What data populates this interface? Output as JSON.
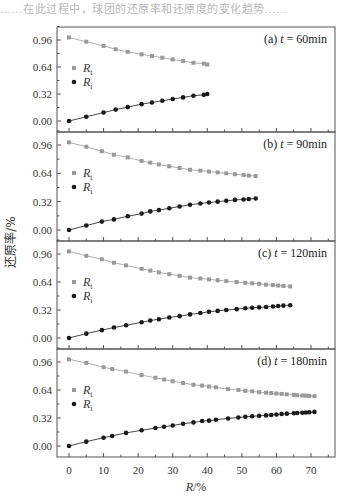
{
  "header": {
    "text": "……在此过程中，球团的还原率和还原度的变化趋势……"
  },
  "figure": {
    "ylabel": "还原率/%",
    "xlabel": "R/%",
    "xlabel_italic_part": "R",
    "xlabel_rest": "/%",
    "x_ticks": [
      0,
      10,
      20,
      30,
      40,
      50,
      60,
      70
    ],
    "y_ticks": [
      "0.00",
      "0.32",
      "0.64",
      "0.96"
    ],
    "legend": [
      {
        "label": "R",
        "sub": "t",
        "marker": "square",
        "color": "#9a9a9a"
      },
      {
        "label": "R",
        "sub": "i",
        "marker": "circle",
        "color": "#1a1a1a"
      }
    ]
  },
  "chart_data": [
    {
      "type": "scatter",
      "title": "(a) t = 60min",
      "panel_label": "(a) ",
      "t_label": "t",
      "t_value": " = 60min",
      "xlabel": "R/%",
      "ylabel": "还原率/%",
      "xlim": [
        -3,
        76
      ],
      "ylim": [
        -0.05,
        1.05
      ],
      "x_ticks": [
        0,
        10,
        20,
        30,
        40,
        50,
        60,
        70
      ],
      "y_ticks": [
        0.0,
        0.32,
        0.64,
        0.96
      ],
      "series": [
        {
          "name": "R_t",
          "marker": "square",
          "color": "#9a9a9a",
          "x": [
            0,
            5,
            10,
            13.5,
            17,
            21,
            24,
            27,
            30,
            33,
            36,
            39,
            40
          ],
          "y": [
            0.99,
            0.94,
            0.89,
            0.85,
            0.82,
            0.79,
            0.77,
            0.75,
            0.73,
            0.71,
            0.69,
            0.68,
            0.67
          ]
        },
        {
          "name": "R_i",
          "marker": "circle",
          "color": "#1a1a1a",
          "x": [
            0,
            5,
            10,
            13.5,
            17,
            21,
            24,
            27,
            30,
            33,
            36,
            39,
            40
          ],
          "y": [
            0.0,
            0.05,
            0.1,
            0.135,
            0.165,
            0.2,
            0.22,
            0.24,
            0.26,
            0.28,
            0.3,
            0.31,
            0.32
          ]
        }
      ]
    },
    {
      "type": "scatter",
      "title": "(b) t = 90min",
      "panel_label": "(b) ",
      "t_label": "t",
      "t_value": " = 90min",
      "xlabel": "R/%",
      "ylabel": "还原率/%",
      "xlim": [
        -3,
        76
      ],
      "ylim": [
        -0.05,
        1.05
      ],
      "x_ticks": [
        0,
        10,
        20,
        30,
        40,
        50,
        60,
        70
      ],
      "y_ticks": [
        0.0,
        0.32,
        0.64,
        0.96
      ],
      "series": [
        {
          "name": "R_t",
          "marker": "square",
          "color": "#9a9a9a",
          "x": [
            0,
            5,
            9.5,
            13,
            17,
            21,
            23.5,
            26,
            29,
            32,
            35,
            38,
            40.5,
            43,
            45.5,
            48,
            50.5,
            52,
            54
          ],
          "y": [
            0.99,
            0.94,
            0.89,
            0.85,
            0.82,
            0.78,
            0.76,
            0.74,
            0.72,
            0.7,
            0.68,
            0.67,
            0.66,
            0.65,
            0.64,
            0.63,
            0.62,
            0.615,
            0.61
          ]
        },
        {
          "name": "R_i",
          "marker": "circle",
          "color": "#1a1a1a",
          "x": [
            0,
            5,
            9.5,
            13,
            17,
            21,
            23.5,
            26,
            29,
            32,
            35,
            38,
            40.5,
            43,
            45.5,
            48,
            50.5,
            52,
            54
          ],
          "y": [
            0.0,
            0.05,
            0.095,
            0.12,
            0.155,
            0.185,
            0.21,
            0.225,
            0.245,
            0.265,
            0.285,
            0.3,
            0.31,
            0.32,
            0.33,
            0.34,
            0.345,
            0.35,
            0.355
          ]
        }
      ]
    },
    {
      "type": "scatter",
      "title": "(c) t = 120min",
      "panel_label": "(c) ",
      "t_label": "t",
      "t_value": " = 120min",
      "xlabel": "R/%",
      "ylabel": "还原率/%",
      "xlim": [
        -3,
        76
      ],
      "ylim": [
        -0.05,
        1.05
      ],
      "x_ticks": [
        0,
        10,
        20,
        30,
        40,
        50,
        60,
        70
      ],
      "y_ticks": [
        0.0,
        0.32,
        0.64,
        0.96
      ],
      "series": [
        {
          "name": "R_t",
          "marker": "square",
          "color": "#9a9a9a",
          "x": [
            0,
            5,
            9.5,
            13,
            16.5,
            21,
            23.5,
            26,
            29,
            32,
            35,
            38,
            40.5,
            43,
            45.5,
            48.5,
            51,
            53,
            55,
            57,
            59,
            60.5,
            62,
            64
          ],
          "y": [
            0.99,
            0.94,
            0.9,
            0.86,
            0.83,
            0.79,
            0.77,
            0.75,
            0.73,
            0.71,
            0.69,
            0.68,
            0.67,
            0.66,
            0.65,
            0.64,
            0.63,
            0.625,
            0.62,
            0.61,
            0.605,
            0.6,
            0.595,
            0.59
          ]
        },
        {
          "name": "R_i",
          "marker": "circle",
          "color": "#1a1a1a",
          "x": [
            0,
            5,
            9.5,
            13,
            16.5,
            21,
            23.5,
            26,
            29,
            32,
            35,
            38,
            40.5,
            43,
            45.5,
            48.5,
            51,
            53,
            55,
            57,
            59,
            60.5,
            62,
            64
          ],
          "y": [
            0.0,
            0.05,
            0.09,
            0.12,
            0.145,
            0.18,
            0.2,
            0.215,
            0.235,
            0.25,
            0.27,
            0.285,
            0.3,
            0.31,
            0.32,
            0.33,
            0.34,
            0.345,
            0.35,
            0.355,
            0.36,
            0.365,
            0.37,
            0.375
          ]
        }
      ]
    },
    {
      "type": "scatter",
      "title": "(d) t = 180min",
      "panel_label": "(d) ",
      "t_label": "t",
      "t_value": " = 180min",
      "xlabel": "R/%",
      "ylabel": "还原率/%",
      "xlim": [
        -3,
        76
      ],
      "ylim": [
        -0.05,
        1.05
      ],
      "x_ticks": [
        0,
        10,
        20,
        30,
        40,
        50,
        60,
        70
      ],
      "y_ticks": [
        0.0,
        0.32,
        0.64,
        0.96
      ],
      "series": [
        {
          "name": "R_t",
          "marker": "square",
          "color": "#9a9a9a",
          "x": [
            0,
            5,
            10,
            12.5,
            16.5,
            21,
            25,
            27.5,
            30,
            33,
            36,
            38.5,
            40.5,
            42.5,
            46,
            49,
            51,
            53,
            55,
            57,
            58.5,
            60,
            61.5,
            63,
            65,
            66,
            67.5,
            68.5,
            69.5,
            71
          ],
          "y": [
            0.99,
            0.95,
            0.9,
            0.88,
            0.85,
            0.81,
            0.78,
            0.76,
            0.74,
            0.72,
            0.7,
            0.69,
            0.68,
            0.67,
            0.65,
            0.64,
            0.63,
            0.625,
            0.615,
            0.61,
            0.605,
            0.6,
            0.595,
            0.59,
            0.585,
            0.58,
            0.578,
            0.575,
            0.572,
            0.57
          ]
        },
        {
          "name": "R_i",
          "marker": "circle",
          "color": "#1a1a1a",
          "x": [
            0,
            5,
            10,
            12.5,
            16.5,
            21,
            25,
            27.5,
            30,
            33,
            36,
            38.5,
            40.5,
            42.5,
            46,
            49,
            51,
            53,
            55,
            57,
            58.5,
            60,
            61.5,
            63,
            65,
            66,
            67.5,
            68.5,
            69.5,
            71
          ],
          "y": [
            0.0,
            0.05,
            0.095,
            0.115,
            0.15,
            0.18,
            0.205,
            0.22,
            0.235,
            0.255,
            0.27,
            0.285,
            0.29,
            0.3,
            0.315,
            0.325,
            0.335,
            0.34,
            0.345,
            0.35,
            0.355,
            0.36,
            0.365,
            0.37,
            0.375,
            0.378,
            0.38,
            0.383,
            0.386,
            0.39
          ]
        }
      ]
    }
  ]
}
